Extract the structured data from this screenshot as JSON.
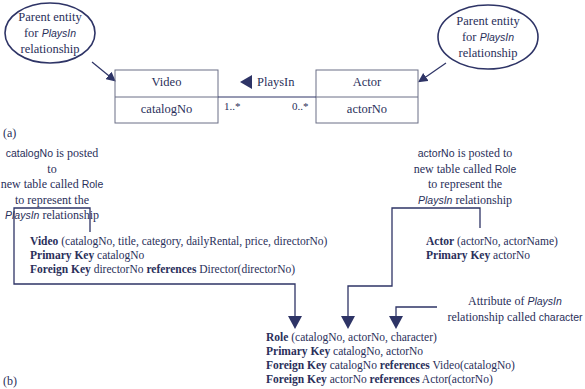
{
  "part_a": {
    "label": "(a)",
    "left_callout": {
      "line1": "Parent entity",
      "line2_prefix": "for ",
      "line2_italic": "PlaysIn",
      "line3": "relationship"
    },
    "right_callout": {
      "line1": "Parent entity",
      "line2_prefix": "for ",
      "line2_italic": "PlaysIn",
      "line3": "relationship"
    },
    "video_entity": {
      "name": "Video",
      "attribute": "catalogNo"
    },
    "actor_entity": {
      "name": "Actor",
      "attribute": "actorNo"
    },
    "relationship": {
      "name": "PlaysIn",
      "direction_glyph": "◀"
    },
    "multiplicity_video": "1..*",
    "multiplicity_actor": "0..*"
  },
  "part_b": {
    "label": "(b)",
    "left_note": {
      "line1_sans": "catalogNo",
      "line1_rest": " is posted to",
      "line2_prefix": "new table called ",
      "line2_sans": "Role",
      "line3": "to represent the",
      "line4_italic": "PlaysIn",
      "line4_rest": " relationship"
    },
    "right_note": {
      "line1_sans": "actorNo",
      "line1_rest": " is posted to",
      "line2_prefix": "new table called ",
      "line2_sans": "Role",
      "line3": "to represent the",
      "line4_italic": "PlaysIn",
      "line4_rest": " relationship"
    },
    "attribute_note": {
      "line1_prefix": "Attribute of ",
      "line1_italic": "PlaysIn",
      "line2_prefix": "relationship called ",
      "line2_sans": "character"
    },
    "video_schema": {
      "relation_name": "Video",
      "relation_attrs": " (catalogNo, title, category, dailyRental, price, directorNo)",
      "pk_label": "Primary Key",
      "pk_value": " catalogNo",
      "fk_label": "Foreign Key",
      "fk_attr": " directorNo ",
      "fk_ref_label": "references",
      "fk_ref_value": " Director(directorNo)"
    },
    "actor_schema": {
      "relation_name": "Actor",
      "relation_attrs": " (actorNo, actorName)",
      "pk_label": "Primary Key",
      "pk_value": " actorNo"
    },
    "role_schema": {
      "relation_name": "Role",
      "relation_attrs": " (catalogNo, actorNo, character)",
      "pk_label": "Primary Key",
      "pk_value": " catalogNo, actorNo",
      "fk1_label": "Foreign Key",
      "fk1_attr": " catalogNo ",
      "fk1_ref_label": "references",
      "fk1_ref_value": " Video(catalogNo)",
      "fk2_label": "Foreign Key",
      "fk2_attr": " actorNo ",
      "fk2_ref_label": "references",
      "fk2_ref_value": " Actor(actorNo)"
    }
  },
  "colors": {
    "ink": "#2a2f5a",
    "line": "#2e3466",
    "box_border": "#6b6f86"
  }
}
